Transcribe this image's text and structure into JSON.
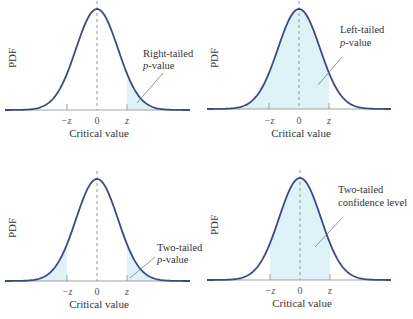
{
  "chart_data": [
    {
      "type": "area",
      "title": "",
      "xlabel": "Critical value",
      "ylabel": "PDF",
      "tick_labels": [
        "−z",
        "0",
        "z"
      ],
      "distribution": "standard normal",
      "shaded_region": "x > z",
      "annotation": [
        "Right-tailed",
        "p-value"
      ],
      "grid": false
    },
    {
      "type": "area",
      "title": "",
      "xlabel": "Critical value",
      "ylabel": "PDF",
      "tick_labels": [
        "−z",
        "0",
        "z"
      ],
      "distribution": "standard normal",
      "shaded_region": "x < z",
      "annotation": [
        "Left-tailed",
        "p-value"
      ],
      "grid": false
    },
    {
      "type": "area",
      "title": "",
      "xlabel": "Critical value",
      "ylabel": "PDF",
      "tick_labels": [
        "−z",
        "0",
        "z"
      ],
      "distribution": "standard normal",
      "shaded_region": "x < −z and x > z",
      "annotation": [
        "Two-tailed",
        "p-value"
      ],
      "grid": false
    },
    {
      "type": "area",
      "title": "",
      "xlabel": "Critical value",
      "ylabel": "PDF",
      "tick_labels": [
        "−z",
        "0",
        "z"
      ],
      "distribution": "standard normal",
      "shaded_region": "−z < x < z",
      "annotation": [
        "Two-tailed",
        "confidence level"
      ],
      "grid": false
    }
  ],
  "colors": {
    "curve": "#3e4a82",
    "fill": "#dff2f7",
    "axis": "#8a8a8a",
    "leader": "#6a6a6a"
  },
  "panels": [
    {
      "ylabel": "PDF",
      "xlabel": "Critical value",
      "ticks": {
        "neg_z": "−z",
        "zero": "0",
        "z": "z"
      },
      "annotation": {
        "line1": "Right-tailed",
        "line2_italic": "p",
        "line2_rest": "-value"
      }
    },
    {
      "ylabel": "PDF",
      "xlabel": "Critical value",
      "ticks": {
        "neg_z": "−z",
        "zero": "0",
        "z": "z"
      },
      "annotation": {
        "line1": "Left-tailed",
        "line2_italic": "p",
        "line2_rest": "-value"
      }
    },
    {
      "ylabel": "PDF",
      "xlabel": "Critical value",
      "ticks": {
        "neg_z": "−z",
        "zero": "0",
        "z": "z"
      },
      "annotation": {
        "line1": "Two-tailed",
        "line2_italic": "p",
        "line2_rest": "-value"
      }
    },
    {
      "ylabel": "PDF",
      "xlabel": "Critical value",
      "ticks": {
        "neg_z": "−z",
        "zero": "0",
        "z": "z"
      },
      "annotation": {
        "line1": "Two-tailed",
        "line2_italic": "",
        "line2_rest": "confidence level"
      }
    }
  ]
}
